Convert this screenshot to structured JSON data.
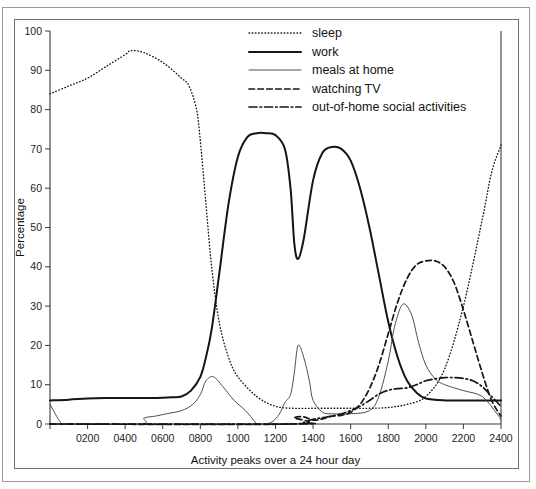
{
  "chart_data": {
    "type": "line",
    "title": "",
    "xlabel": "Activity peaks over a 24 hour day",
    "ylabel": "Percentage",
    "xlim": [
      0,
      2400
    ],
    "ylim": [
      0,
      100
    ],
    "xticks": [
      0,
      200,
      400,
      600,
      800,
      1000,
      1200,
      1400,
      1600,
      1800,
      2000,
      2200,
      2400
    ],
    "xticklabels": [
      "",
      "0200",
      "0400",
      "0600",
      "0800",
      "1000",
      "1200",
      "1400",
      "1600",
      "1800",
      "2000",
      "2200",
      "2400"
    ],
    "yticks": [
      0,
      10,
      20,
      30,
      40,
      50,
      60,
      70,
      80,
      90,
      100
    ],
    "yticklabels": [
      "0",
      "10",
      "20",
      "30",
      "40",
      "50",
      "60",
      "70",
      "80",
      "90",
      "100"
    ],
    "grid": false,
    "legend_position": "top-right",
    "series": [
      {
        "name": "sleep",
        "style": "dotted",
        "x": [
          0,
          100,
          200,
          300,
          400,
          430,
          500,
          600,
          700,
          740,
          780,
          800,
          830,
          860,
          900,
          950,
          1000,
          1100,
          1200,
          1300,
          1400,
          1500,
          1600,
          1700,
          1800,
          1900,
          2000,
          2100,
          2200,
          2300,
          2350,
          2400
        ],
        "values": [
          84,
          86,
          88,
          91,
          94,
          95,
          94.5,
          92,
          88,
          86,
          80,
          72,
          56,
          40,
          26,
          17,
          12,
          7,
          4.5,
          4,
          4,
          4,
          4,
          4,
          4.2,
          5,
          7,
          14,
          30,
          52,
          64,
          71
        ]
      },
      {
        "name": "work",
        "style": "solid",
        "x": [
          0,
          100,
          200,
          300,
          400,
          500,
          600,
          650,
          700,
          750,
          800,
          830,
          860,
          900,
          950,
          1000,
          1050,
          1100,
          1150,
          1200,
          1250,
          1280,
          1300,
          1320,
          1350,
          1400,
          1450,
          1500,
          1550,
          1600,
          1650,
          1700,
          1750,
          1800,
          1850,
          1900,
          1950,
          2000,
          2100,
          2200,
          2300,
          2400
        ],
        "values": [
          6,
          6.2,
          6.5,
          6.6,
          6.6,
          6.6,
          6.7,
          6.8,
          7,
          8.5,
          12,
          17,
          24,
          38,
          56,
          68,
          73,
          74,
          74,
          73.5,
          70,
          60,
          46,
          42,
          47,
          62,
          69,
          70.5,
          70,
          67,
          60,
          50,
          38,
          26,
          17,
          11,
          8,
          6.5,
          6,
          6,
          6,
          6
        ]
      },
      {
        "name": "meals at home",
        "style": "solid-thin",
        "x": [
          0,
          60,
          100,
          480,
          500,
          560,
          620,
          700,
          760,
          800,
          830,
          870,
          920,
          980,
          1040,
          1090,
          1100,
          1140,
          1180,
          1220,
          1250,
          1280,
          1300,
          1320,
          1350,
          1380,
          1400,
          1450,
          1500,
          1600,
          1700,
          1750,
          1800,
          1830,
          1860,
          1880,
          1900,
          1930,
          1960,
          2000,
          2050,
          2100,
          2200,
          2300,
          2380,
          2400
        ],
        "values": [
          5,
          0.2,
          0,
          0,
          1.5,
          2,
          2.6,
          3.4,
          5,
          7.5,
          11,
          12,
          9.5,
          6,
          3.4,
          0.6,
          0,
          0,
          0.5,
          2.5,
          5.5,
          7.5,
          13,
          20,
          17,
          11,
          6,
          3,
          2.6,
          2.6,
          3.4,
          7,
          16,
          24,
          29,
          30.5,
          30,
          27,
          21,
          15,
          11.5,
          10,
          8.5,
          7,
          2.5,
          1
        ]
      },
      {
        "name": "watching TV",
        "style": "dashed",
        "x": [
          0,
          1280,
          1300,
          1350,
          1400,
          1450,
          1500,
          1550,
          1600,
          1650,
          1700,
          1750,
          1800,
          1850,
          1900,
          1950,
          2000,
          2050,
          2100,
          2150,
          2200,
          2250,
          2300,
          2350,
          2400
        ],
        "values": [
          0,
          0,
          1.6,
          1.8,
          1,
          1.3,
          2,
          2.2,
          3,
          5,
          9,
          15,
          23,
          31,
          37,
          40.5,
          41.5,
          41.5,
          40,
          36,
          29,
          21,
          13,
          6,
          2
        ]
      },
      {
        "name": "out-of-home social activities",
        "style": "dash-dot",
        "x": [
          0,
          1300,
          1350,
          1400,
          1450,
          1500,
          1550,
          1600,
          1650,
          1700,
          1750,
          1800,
          1850,
          1900,
          1950,
          2000,
          2050,
          2100,
          2150,
          2200,
          2250,
          2300,
          2350,
          2400
        ],
        "values": [
          0,
          0,
          0.4,
          1.2,
          1.6,
          2,
          2.6,
          3.4,
          4.5,
          6,
          7.6,
          8.6,
          9,
          9.2,
          10,
          11,
          11.5,
          11.8,
          11.8,
          11.6,
          11,
          9.5,
          7,
          4.5
        ]
      }
    ]
  },
  "legend": {
    "items": [
      {
        "label": "sleep",
        "key": "dotted"
      },
      {
        "label": "work",
        "key": "solid"
      },
      {
        "label": "meals at home",
        "key": "solid-thin"
      },
      {
        "label": "watching TV",
        "key": "dashed"
      },
      {
        "label": "out-of-home social activities",
        "key": "dash-dot"
      }
    ]
  }
}
